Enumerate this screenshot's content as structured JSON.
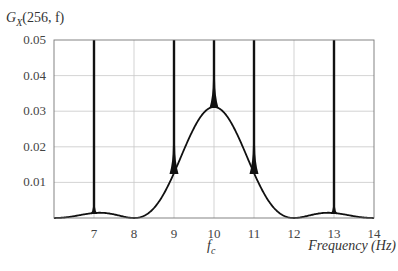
{
  "chart_data": {
    "type": "line",
    "title": "",
    "ylabel": "G_X(256, f)",
    "ylabel_parts": {
      "base": "G",
      "sub": "X",
      "args": "(256, f)"
    },
    "xlabel": "Frequency (Hz)",
    "x_annotation": {
      "label": "f",
      "sub": "c",
      "at": 10
    },
    "xlim": [
      6,
      14
    ],
    "ylim": [
      0,
      0.05
    ],
    "xticks": [
      7,
      8,
      9,
      10,
      11,
      12,
      13,
      14
    ],
    "xtick_labels": [
      "7",
      "8",
      "9",
      "10",
      "11",
      "12",
      "13",
      "14"
    ],
    "yticks": [
      0.01,
      0.02,
      0.03,
      0.04,
      0.05
    ],
    "ytick_labels": [
      "0.01",
      "0.02",
      "0.03",
      "0.04",
      "0.05"
    ],
    "grid": true,
    "legend": null,
    "series": [
      {
        "name": "spectral density (continuous)",
        "description": "sinc^2 main lobe centred at fc = 10 Hz, zeros at 8 and 12 Hz, side lobes near 7 and 13 Hz",
        "x": [
          6.0,
          6.5,
          7.0,
          7.5,
          8.0,
          8.5,
          9.0,
          9.5,
          10.0,
          10.5,
          11.0,
          11.5,
          12.0,
          12.5,
          13.0,
          13.5,
          14.0
        ],
        "values": [
          0.0,
          0.0004,
          0.0014,
          0.001,
          0.0,
          0.0025,
          0.0126,
          0.0253,
          0.0312,
          0.0253,
          0.0126,
          0.0025,
          0.0,
          0.001,
          0.0014,
          0.0004,
          0.0
        ]
      },
      {
        "name": "spectral lines (spikes)",
        "x": [
          7,
          9,
          10,
          11,
          13
        ],
        "values": [
          0.05,
          0.05,
          0.05,
          0.05,
          0.05
        ],
        "note": "spikes extend beyond top of axis (clipped at 0.05)"
      }
    ],
    "peak": {
      "f": 10,
      "value": 0.0312
    }
  }
}
